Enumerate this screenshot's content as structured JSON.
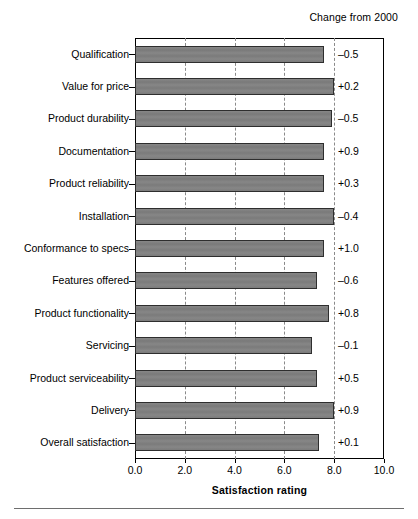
{
  "header": {
    "change_header": "Change from 2000"
  },
  "chart_data": {
    "type": "bar",
    "orientation": "horizontal",
    "title": "",
    "xlabel": "Satisfaction rating",
    "ylabel": "",
    "xlim": [
      0.0,
      10.0
    ],
    "xticks": [
      "0.0",
      "2.0",
      "4.0",
      "6.0",
      "8.0",
      "10.0"
    ],
    "xtick_values": [
      0.0,
      2.0,
      4.0,
      6.0,
      8.0,
      10.0
    ],
    "grid": "vertical-dashed",
    "legend": "none",
    "bar_color": "#808080",
    "bar_edge_color": "#2e2e2e",
    "categories": [
      "Qualification",
      "Value for price",
      "Product durability",
      "Documentation",
      "Product reliability",
      "Installation",
      "Conformance to specs",
      "Features offered",
      "Product functionality",
      "Servicing",
      "Product serviceability",
      "Delivery",
      "Overall satisfaction"
    ],
    "values": [
      7.6,
      8.0,
      7.9,
      7.6,
      7.6,
      8.0,
      7.6,
      7.3,
      7.8,
      7.1,
      7.3,
      8.0,
      7.4
    ],
    "annotations": {
      "label": "Change from 2000",
      "values": [
        "–0.5",
        "+0.2",
        "–0.5",
        "+0.9",
        "+0.3",
        "–0.4",
        "+1.0",
        "–0.6",
        "+0.8",
        "–0.1",
        "+0.5",
        "+0.9",
        "+0.1"
      ],
      "numeric": [
        -0.5,
        0.2,
        -0.5,
        0.9,
        0.3,
        -0.4,
        1.0,
        -0.6,
        0.8,
        -0.1,
        0.5,
        0.9,
        0.1
      ]
    }
  }
}
